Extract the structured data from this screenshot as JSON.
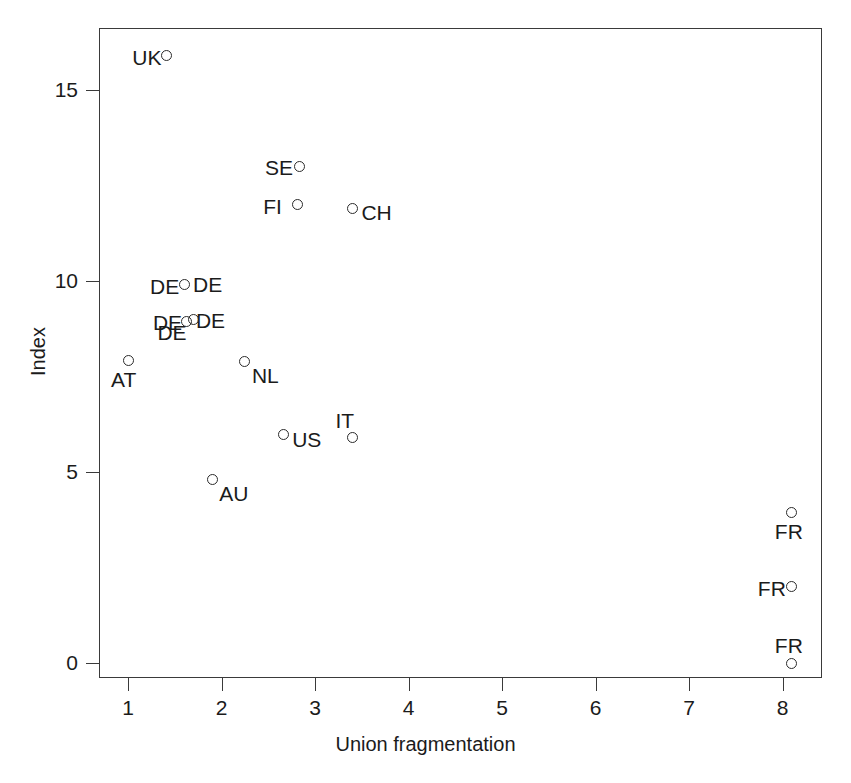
{
  "chart_data": {
    "type": "scatter",
    "title": "",
    "xlabel": "Union fragmentation",
    "ylabel": "Index",
    "xlim": [
      0.72,
      8.45
    ],
    "ylim": [
      -0.55,
      16.9
    ],
    "xticks": [
      1,
      2,
      3,
      4,
      5,
      6,
      7,
      8
    ],
    "yticks": [
      0,
      5,
      10,
      15
    ],
    "xtick_labels": [
      "1",
      "2",
      "3",
      "4",
      "5",
      "6",
      "7",
      "8"
    ],
    "ytick_labels": [
      "0",
      "5",
      "10",
      "15"
    ],
    "grid": false,
    "legend": "none",
    "marker": "open-circle",
    "points": [
      {
        "label": "UK",
        "x": 1.41,
        "y": 15.9,
        "label_pos": "left"
      },
      {
        "label": "SE",
        "x": 2.83,
        "y": 13.0,
        "label_pos": "left"
      },
      {
        "label": "FI",
        "x": 2.81,
        "y": 12.0,
        "label_pos": "left"
      },
      {
        "label": "CH",
        "x": 3.4,
        "y": 11.9,
        "label_pos": "right"
      },
      {
        "label": "DE",
        "x": 1.6,
        "y": 9.9,
        "label_pos": "both"
      },
      {
        "label": "DE",
        "x": 1.63,
        "y": 8.95,
        "label_pos": "both"
      },
      {
        "label": "DE",
        "x": 1.7,
        "y": 9.0,
        "label_pos": "lower-left"
      },
      {
        "label": "AT",
        "x": 1.0,
        "y": 7.93,
        "label_pos": "below"
      },
      {
        "label": "NL",
        "x": 2.25,
        "y": 7.88,
        "label_pos": "lower-right"
      },
      {
        "label": "US",
        "x": 2.66,
        "y": 5.97,
        "label_pos": "right"
      },
      {
        "label": "IT",
        "x": 3.4,
        "y": 5.9,
        "label_pos": "above"
      },
      {
        "label": "AU",
        "x": 1.9,
        "y": 4.8,
        "label_pos": "lower-right"
      },
      {
        "label": "FR",
        "x": 8.1,
        "y": 3.95,
        "label_pos": "below"
      },
      {
        "label": "FR",
        "x": 8.1,
        "y": 2.0,
        "label_pos": "left"
      },
      {
        "label": "FR",
        "x": 8.1,
        "y": 0.0,
        "label_pos": "above"
      }
    ]
  },
  "axes": {
    "x_label": "Union fragmentation",
    "y_label": "Index"
  },
  "colors": {
    "axis": "#3a3a3a",
    "text": "#1b1b1b",
    "marker": "#2b2b2b",
    "background": "#ffffff"
  }
}
